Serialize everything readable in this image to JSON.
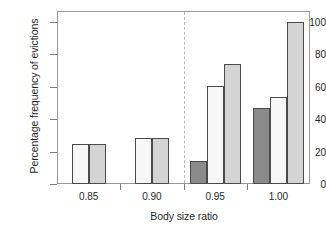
{
  "chart_data": {
    "type": "bar",
    "title": "",
    "xlabel": "Body size ratio",
    "ylabel": "Percentage frequency of evictions",
    "categories": [
      "0.85",
      "0.90",
      "0.95",
      "1.00"
    ],
    "ylim": [
      0,
      100
    ],
    "yticks": [
      0,
      20,
      40,
      60,
      80,
      100
    ],
    "ytick_labels": [
      "0",
      "20",
      "40",
      "60",
      "80",
      "100"
    ],
    "grid": false,
    "legend": "none",
    "series": [
      {
        "name": "dark-gray",
        "color": "#8a8a8a",
        "values": [
          null,
          null,
          14,
          47
        ]
      },
      {
        "name": "near-white",
        "color": "#f7f7f7",
        "values": [
          25,
          28.5,
          60.5,
          53.5
        ]
      },
      {
        "name": "light-gray",
        "color": "#d4d4d4",
        "values": [
          25,
          28.5,
          74,
          100
        ]
      }
    ],
    "annotations": [
      {
        "name": "vertical-dashed-separator",
        "type": "vline",
        "x_between": [
          "0.90",
          "0.95"
        ],
        "style": "dashed",
        "color": "#b9b9b9"
      }
    ],
    "axis_color": "#9a9a9a",
    "bar_edge_color": "#4a4a4a",
    "background": "#ffffff"
  }
}
